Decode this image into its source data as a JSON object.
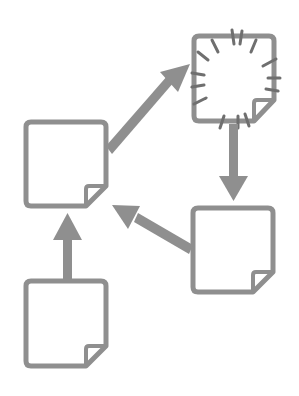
{
  "diagram": {
    "title": "",
    "colors": {
      "stroke": "#8f8f8f",
      "fill": "#ffffff",
      "background": "#ffffff"
    },
    "nodes": [
      {
        "id": "note-top-left",
        "icon": "sticky-note-icon",
        "highlighted": false
      },
      {
        "id": "note-top-right",
        "icon": "sticky-note-burst-icon",
        "highlighted": true
      },
      {
        "id": "note-right",
        "icon": "sticky-note-icon",
        "highlighted": false
      },
      {
        "id": "note-bottom",
        "icon": "sticky-note-icon",
        "highlighted": false
      }
    ],
    "edges": [
      {
        "from": "note-bottom",
        "to": "note-top-left",
        "icon": "arrow-up-icon"
      },
      {
        "from": "note-top-left",
        "to": "note-top-right",
        "icon": "arrow-diagonal-up-right-icon"
      },
      {
        "from": "note-top-right",
        "to": "note-right",
        "icon": "arrow-down-icon"
      },
      {
        "from": "note-right",
        "to": "note-top-left",
        "icon": "arrow-diagonal-up-left-icon"
      }
    ]
  }
}
